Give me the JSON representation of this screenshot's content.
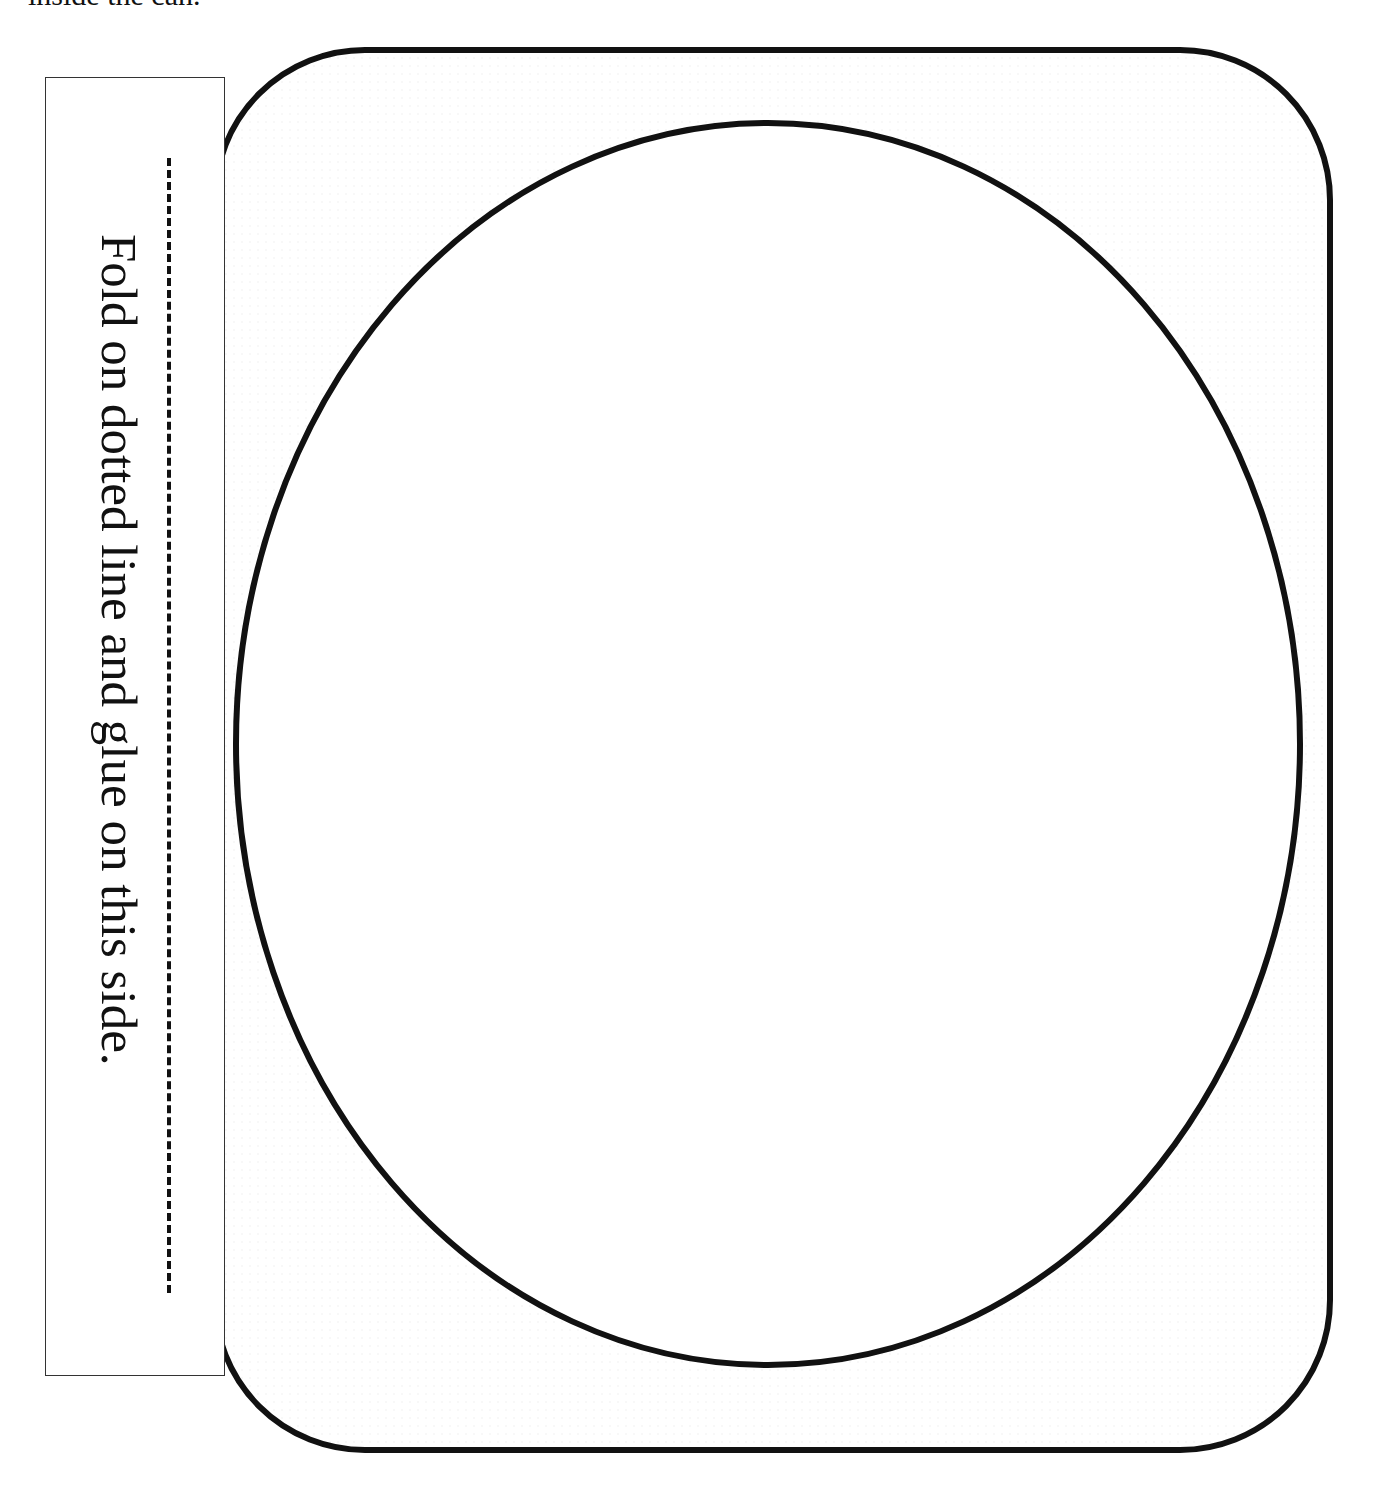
{
  "document": {
    "top_text": "inside the can.",
    "tab": {
      "instruction": "Fold on dotted line and glue on this side."
    },
    "template": {
      "outer_shape": "rounded-rectangle",
      "inner_shape": "ellipse",
      "stroke_color": "#111111",
      "background_color": "#ffffff"
    }
  }
}
